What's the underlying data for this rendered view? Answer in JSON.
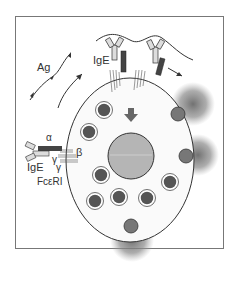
{
  "diagram": {
    "type": "mast-cell-degranulation",
    "labels": {
      "ag": "Ag",
      "ige_top": "IgE",
      "ige_left": "IgE",
      "alpha": "α",
      "beta": "β",
      "gamma1": "γ",
      "gamma2": "γ",
      "receptor": "FcεRI"
    },
    "colors": {
      "frame": "#777777",
      "cell_fill": "#fafafa",
      "nucleus": "#b5b5b5",
      "granule_dark": "#555555",
      "granule_ring": "#ffffff",
      "receptor_dark": "#444444",
      "ige_light": "#dddddd",
      "release_cloud": "#8a8a8a",
      "signal_arrow": "#666666"
    },
    "granules_inside": 8,
    "degranulation_sites": 3
  }
}
